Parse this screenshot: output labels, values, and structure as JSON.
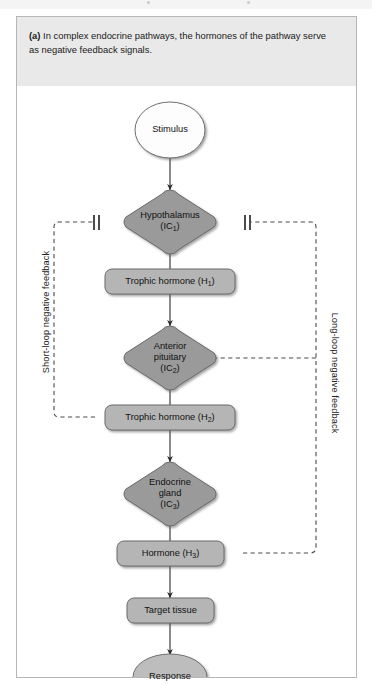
{
  "figure": {
    "caption_label": "(a)",
    "caption_text": "In complex endocrine pathways, the hormones of the pathway serve as negative feedback signals."
  },
  "diagram": {
    "type": "flowchart",
    "orientation": "vertical",
    "nodes": [
      {
        "id": "stimulus",
        "label": "Stimulus",
        "shape": "ellipse",
        "fill": "#ffffff"
      },
      {
        "id": "hypothalamus",
        "label": "Hypothalamus",
        "sublabel": "(IC1)",
        "shape": "rounded-diamond",
        "fill": "#9a9a9a"
      },
      {
        "id": "trophic-hormone-1",
        "label": "Trophic hormone (H1)",
        "shape": "rounded-rect",
        "fill": "#b5b5b5"
      },
      {
        "id": "anterior-pituitary",
        "label": "Anterior pituitary",
        "sublabel": "(IC2)",
        "shape": "rounded-diamond",
        "fill": "#9a9a9a"
      },
      {
        "id": "trophic-hormone-2",
        "label": "Trophic hormone (H2)",
        "shape": "rounded-rect",
        "fill": "#b5b5b5"
      },
      {
        "id": "endocrine-gland",
        "label": "Endocrine gland",
        "sublabel": "(IC3)",
        "shape": "rounded-diamond",
        "fill": "#9a9a9a"
      },
      {
        "id": "hormone-3",
        "label": "Hormone (H3)",
        "shape": "rounded-rect",
        "fill": "#b5b5b5"
      },
      {
        "id": "target-tissue",
        "label": "Target tissue",
        "shape": "rounded-rect",
        "fill": "#b5b5b5"
      },
      {
        "id": "response",
        "label": "Response",
        "shape": "ellipse",
        "fill": "#bdbdbd"
      }
    ],
    "node_text": {
      "stimulus": "Stimulus",
      "hypothalamus_line1": "Hypothalamus",
      "hypothalamus_line2": "(IC",
      "hypothalamus_sub": "1",
      "hypothalamus_line2_end": ")",
      "trophic1_pre": "Trophic hormone (H",
      "trophic1_sub": "1",
      "trophic1_post": ")",
      "pituitary_line1": "Anterior",
      "pituitary_line2": "pituitary",
      "pituitary_line3_pre": "(IC",
      "pituitary_sub": "2",
      "pituitary_line3_post": ")",
      "trophic2_pre": "Trophic hormone (H",
      "trophic2_sub": "2",
      "trophic2_post": ")",
      "gland_line1": "Endocrine",
      "gland_line2": "gland",
      "gland_line3_pre": "(IC",
      "gland_sub": "3",
      "gland_line3_post": ")",
      "hormone3_pre": "Hormone (H",
      "hormone3_sub": "3",
      "hormone3_post": ")",
      "target_tissue": "Target tissue",
      "response": "Response"
    },
    "feedback_loops": [
      {
        "id": "short-loop",
        "label": "Short-loop negative feedback",
        "style": "dashed",
        "from": "trophic-hormone-2",
        "to": "hypothalamus",
        "side": "left",
        "terminator": "inhibition-bars"
      },
      {
        "id": "long-loop",
        "label": "Long-loop negative feedback",
        "style": "dashed",
        "from": "hormone-3",
        "to": [
          "hypothalamus",
          "anterior-pituitary"
        ],
        "side": "right",
        "terminator": "inhibition-bars"
      }
    ],
    "colors": {
      "diamond_fill": "#9a9a9a",
      "box_fill": "#b5b5b5",
      "ellipse_stimulus_fill": "#fdfdfd",
      "ellipse_response_fill": "#bdbdbd",
      "stroke": "#4f4f4f",
      "caption_band": "#e9e9e9",
      "panel_border": "#b6b6b6"
    }
  }
}
